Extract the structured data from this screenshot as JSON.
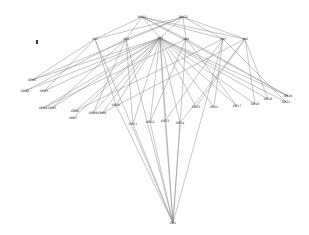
{
  "diagram": {
    "type": "network-graph",
    "background": "#ffffff",
    "edge_color": "#8a8a8a",
    "node_color": "#333333",
    "nodes": [
      {
        "id": "A",
        "label": "DRG1",
        "x": 142,
        "y": 17
      },
      {
        "id": "B",
        "label": "DRG2",
        "x": 183,
        "y": 17
      },
      {
        "id": "m1",
        "label": "V01",
        "x": 95,
        "y": 39
      },
      {
        "id": "m2",
        "label": "V02",
        "x": 126,
        "y": 39
      },
      {
        "id": "m3",
        "label": "V03",
        "x": 160,
        "y": 38
      },
      {
        "id": "m4",
        "label": "V04",
        "x": 186,
        "y": 39
      },
      {
        "id": "m5",
        "label": "V05",
        "x": 223,
        "y": 39
      },
      {
        "id": "m6",
        "label": "V06",
        "x": 245,
        "y": 39
      },
      {
        "id": "iso",
        "label": "",
        "x": 37,
        "y": 42
      },
      {
        "id": "L1",
        "label": "GR01",
        "x": 32,
        "y": 80
      },
      {
        "id": "L2",
        "label": "GR02",
        "x": 25,
        "y": 91
      },
      {
        "id": "L3",
        "label": "GR03",
        "x": 44,
        "y": 91
      },
      {
        "id": "L4",
        "label": "GR04",
        "x": 43,
        "y": 108
      },
      {
        "id": "L5",
        "label": "GR05",
        "x": 52,
        "y": 108
      },
      {
        "id": "L6",
        "label": "GR06",
        "x": 75,
        "y": 111
      },
      {
        "id": "L7",
        "label": "GR07",
        "x": 73,
        "y": 118
      },
      {
        "id": "L8",
        "label": "GR08",
        "x": 93,
        "y": 113
      },
      {
        "id": "L9",
        "label": "GR09",
        "x": 102,
        "y": 113
      },
      {
        "id": "L10",
        "label": "GR10",
        "x": 116,
        "y": 105
      },
      {
        "id": "C1",
        "label": "GR11",
        "x": 133,
        "y": 124
      },
      {
        "id": "C2",
        "label": "GR12",
        "x": 150,
        "y": 122
      },
      {
        "id": "C3",
        "label": "GR13",
        "x": 165,
        "y": 121
      },
      {
        "id": "C4",
        "label": "GR14",
        "x": 180,
        "y": 123
      },
      {
        "id": "R1",
        "label": "GR15",
        "x": 196,
        "y": 107
      },
      {
        "id": "R2",
        "label": "GR16",
        "x": 214,
        "y": 107
      },
      {
        "id": "R3",
        "label": "GR17",
        "x": 237,
        "y": 106
      },
      {
        "id": "R4",
        "label": "GR18",
        "x": 255,
        "y": 104
      },
      {
        "id": "R5",
        "label": "GR19",
        "x": 268,
        "y": 99
      },
      {
        "id": "R6",
        "label": "GR20",
        "x": 288,
        "y": 96
      },
      {
        "id": "R7",
        "label": "GR21",
        "x": 286,
        "y": 102
      },
      {
        "id": "Z",
        "label": "ZN1",
        "x": 173,
        "y": 223
      }
    ],
    "edges": [
      [
        "A",
        "m1"
      ],
      [
        "A",
        "m2"
      ],
      [
        "A",
        "m3"
      ],
      [
        "A",
        "m4"
      ],
      [
        "A",
        "m5"
      ],
      [
        "A",
        "m6"
      ],
      [
        "B",
        "m1"
      ],
      [
        "B",
        "m2"
      ],
      [
        "B",
        "m3"
      ],
      [
        "B",
        "m4"
      ],
      [
        "B",
        "m5"
      ],
      [
        "B",
        "m6"
      ],
      [
        "m3",
        "L1"
      ],
      [
        "m3",
        "L2"
      ],
      [
        "m3",
        "L3"
      ],
      [
        "m3",
        "L4"
      ],
      [
        "m3",
        "L5"
      ],
      [
        "m3",
        "L6"
      ],
      [
        "m3",
        "L7"
      ],
      [
        "m3",
        "L8"
      ],
      [
        "m3",
        "L9"
      ],
      [
        "m3",
        "L10"
      ],
      [
        "m3",
        "C1"
      ],
      [
        "m3",
        "C2"
      ],
      [
        "m3",
        "C3"
      ],
      [
        "m3",
        "C4"
      ],
      [
        "m3",
        "R1"
      ],
      [
        "m3",
        "R2"
      ],
      [
        "m3",
        "R3"
      ],
      [
        "m3",
        "R4"
      ],
      [
        "m3",
        "R5"
      ],
      [
        "m3",
        "R6"
      ],
      [
        "m3",
        "R7"
      ],
      [
        "m1",
        "L1"
      ],
      [
        "m1",
        "L3"
      ],
      [
        "m1",
        "L10"
      ],
      [
        "m2",
        "L2"
      ],
      [
        "m2",
        "L5"
      ],
      [
        "m2",
        "C1"
      ],
      [
        "m2",
        "L8"
      ],
      [
        "m4",
        "L4"
      ],
      [
        "m4",
        "C2"
      ],
      [
        "m4",
        "R3"
      ],
      [
        "m4",
        "R6"
      ],
      [
        "m5",
        "L6"
      ],
      [
        "m5",
        "C3"
      ],
      [
        "m5",
        "R2"
      ],
      [
        "m5",
        "R7"
      ],
      [
        "m6",
        "L9"
      ],
      [
        "m6",
        "C4"
      ],
      [
        "m6",
        "R1"
      ],
      [
        "m6",
        "R5"
      ],
      [
        "m6",
        "R4"
      ],
      [
        "A",
        "R6"
      ],
      [
        "B",
        "L1"
      ],
      [
        "Z",
        "m1"
      ],
      [
        "Z",
        "m2"
      ],
      [
        "Z",
        "m3"
      ],
      [
        "Z",
        "m4"
      ],
      [
        "Z",
        "m5"
      ],
      [
        "Z",
        "C1"
      ],
      [
        "Z",
        "C2"
      ],
      [
        "Z",
        "C3"
      ],
      [
        "Z",
        "C4"
      ],
      [
        "Z",
        "L10"
      ]
    ]
  }
}
